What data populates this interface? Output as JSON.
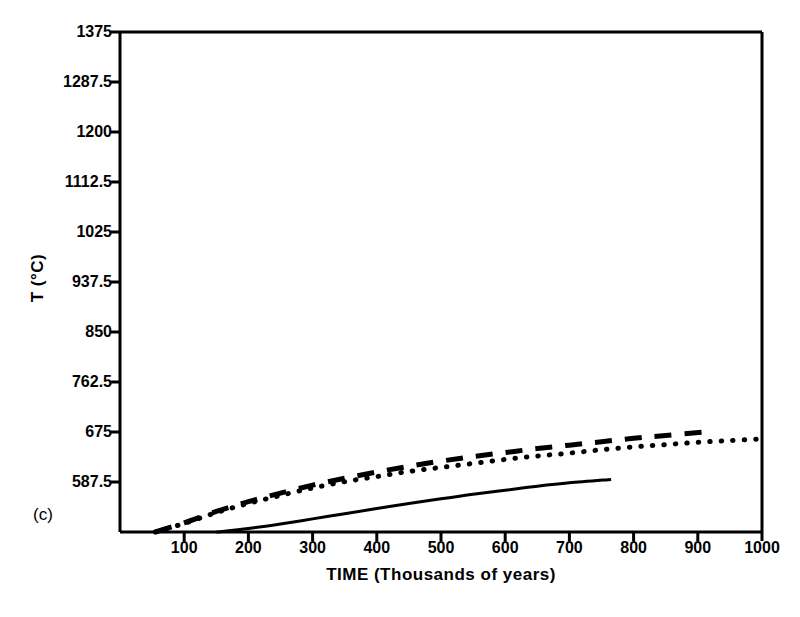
{
  "figure": {
    "panel_tag": "(c)",
    "background_color": "#ffffff",
    "ink_color": "#000000"
  },
  "chart_data": {
    "type": "line",
    "title": "",
    "subtitle": "",
    "panel_label": "(c)",
    "xlabel": "TIME (Thousands of years)",
    "ylabel": "T (°C)",
    "xlim": [
      0,
      1000
    ],
    "ylim": [
      500,
      1375
    ],
    "grid": false,
    "legend": "none",
    "xticks": [
      100,
      200,
      300,
      400,
      500,
      600,
      700,
      800,
      900,
      1000
    ],
    "xtick_labels": [
      "100",
      "200",
      "300",
      "400",
      "500",
      "600",
      "700",
      "800",
      "900",
      "1000"
    ],
    "yticks": [
      587.5,
      675,
      762.5,
      850,
      937.5,
      1025,
      1112.5,
      1200,
      1287.5,
      1375
    ],
    "ytick_labels": [
      "587.5",
      "675",
      "762.5",
      "850",
      "937.5",
      "1025",
      "1112.5",
      "1200",
      "1287.5",
      "1375"
    ],
    "series": [
      {
        "name": "dashed-curve",
        "style": "dashed",
        "x": [
          55,
          100,
          150,
          200,
          250,
          300,
          350,
          400,
          450,
          500,
          550,
          600,
          650,
          700,
          750,
          800,
          850,
          910
        ],
        "y": [
          500,
          516,
          536,
          553,
          568,
          582,
          594,
          605,
          615,
          624,
          632,
          639,
          646,
          652,
          658,
          664,
          669,
          675
        ]
      },
      {
        "name": "dotted-curve",
        "style": "dotted",
        "x": [
          55,
          100,
          150,
          200,
          250,
          300,
          350,
          400,
          450,
          500,
          550,
          600,
          650,
          700,
          750,
          800,
          850,
          900,
          950,
          1000
        ],
        "y": [
          500,
          515,
          534,
          550,
          564,
          577,
          588,
          597,
          606,
          613,
          620,
          627,
          633,
          638,
          644,
          649,
          653,
          657,
          660,
          663
        ]
      },
      {
        "name": "solid-curve",
        "style": "solid",
        "x": [
          150,
          200,
          250,
          300,
          350,
          400,
          450,
          500,
          550,
          600,
          650,
          700,
          765
        ],
        "y": [
          500,
          506,
          514,
          523,
          532,
          541,
          550,
          558,
          566,
          573,
          580,
          586,
          592
        ]
      }
    ]
  }
}
